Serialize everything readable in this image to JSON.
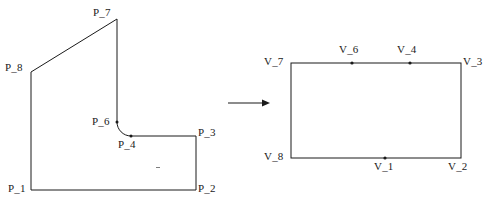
{
  "figure": {
    "stroke_color": "#1a1a1a",
    "background_color": "#ffffff",
    "transform_arrow": {
      "name": "maps-to-arrow",
      "x1": 228,
      "y1": 103,
      "x2": 270,
      "y2": 103
    },
    "left_shape": {
      "name": "source-polygon",
      "labels": [
        {
          "id": "P_1",
          "text": "P_1",
          "x": 8,
          "y": 185,
          "anchor": "left-of-vertex"
        },
        {
          "id": "P_2",
          "text": "P_2",
          "x": 198,
          "y": 185,
          "anchor": "right-of-vertex"
        },
        {
          "id": "P_3",
          "text": "P_3",
          "x": 198,
          "y": 128,
          "anchor": "right-of-vertex"
        },
        {
          "id": "P_4",
          "text": "P_4",
          "x": 119,
          "y": 140,
          "anchor": "below-vertex"
        },
        {
          "id": "P_6",
          "text": "P_6",
          "x": 92,
          "y": 117,
          "anchor": "left-of-vertex"
        },
        {
          "id": "P_7",
          "text": "P_7",
          "x": 93,
          "y": 8,
          "anchor": "above-vertex"
        },
        {
          "id": "P_8",
          "text": "P_8",
          "x": 5,
          "y": 63,
          "anchor": "left-of-vertex"
        }
      ],
      "vertices": [
        {
          "id": "P_1",
          "x": 31,
          "y": 190
        },
        {
          "id": "P_2",
          "x": 196,
          "y": 190
        },
        {
          "id": "P_3",
          "x": 196,
          "y": 136
        },
        {
          "id": "P_4",
          "x": 131,
          "y": 136
        },
        {
          "id": "P_6",
          "x": 117,
          "y": 122
        },
        {
          "id": "P_7",
          "x": 117,
          "y": 19
        },
        {
          "id": "P_8",
          "x": 31,
          "y": 72
        }
      ],
      "marked_points": [
        "P_4",
        "P_6"
      ],
      "path": "M 31 190 L 196 190 L 196 136 L 131 136 C 123.3 136 117 129.7 117 122 L 117 19 L 31 72 L 31 190 Z",
      "fillet_note": "rounded corner between P_4 and P_6"
    },
    "right_shape": {
      "name": "target-rectangle",
      "rect": {
        "x": 291,
        "y": 63,
        "width": 170,
        "height": 95
      },
      "labels": [
        {
          "id": "V_7",
          "text": "V_7",
          "x": 265,
          "y": 57,
          "anchor": "left-of-corner"
        },
        {
          "id": "V_6",
          "text": "V_6",
          "x": 338,
          "y": 45,
          "anchor": "above-edge"
        },
        {
          "id": "V_4",
          "text": "V_4",
          "x": 396,
          "y": 45,
          "anchor": "above-edge"
        },
        {
          "id": "V_3",
          "text": "V_3",
          "x": 463,
          "y": 57,
          "anchor": "right-of-corner"
        },
        {
          "id": "V_8",
          "text": "V_8",
          "x": 265,
          "y": 152,
          "anchor": "left-of-corner"
        },
        {
          "id": "V_1",
          "text": "V_1",
          "x": 374,
          "y": 162,
          "anchor": "below-edge"
        },
        {
          "id": "V_2",
          "text": "V_2",
          "x": 448,
          "y": 162,
          "anchor": "below-corner"
        }
      ],
      "vertices": [
        {
          "id": "V_7",
          "x": 291,
          "y": 63
        },
        {
          "id": "V_6",
          "x": 352,
          "y": 63
        },
        {
          "id": "V_4",
          "x": 410,
          "y": 63
        },
        {
          "id": "V_3",
          "x": 461,
          "y": 63
        },
        {
          "id": "V_2",
          "x": 461,
          "y": 158
        },
        {
          "id": "V_1",
          "x": 385,
          "y": 158
        },
        {
          "id": "V_8",
          "x": 291,
          "y": 158
        }
      ],
      "marked_points": [
        "V_6",
        "V_4",
        "V_1"
      ]
    },
    "speck": {
      "x": 158,
      "y": 167,
      "width": 4,
      "height": 1
    }
  }
}
